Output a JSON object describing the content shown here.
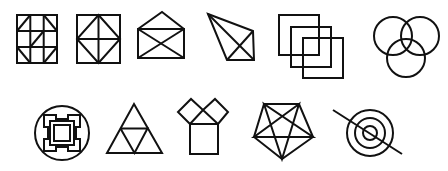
{
  "figure": {
    "background_color": "#ffffff",
    "stroke_color": "#111111",
    "rows": [
      {
        "shapes": [
          {
            "id": "grid-square-diagonals",
            "label": "3x3 grid square with corner and center diagonals"
          },
          {
            "id": "square-diamond-cross",
            "label": "Square with inscribed diamond and cross"
          },
          {
            "id": "open-envelope",
            "label": "Open envelope"
          },
          {
            "id": "kite-quadrilateral",
            "label": "Quadrilateral with both diagonals"
          },
          {
            "id": "overlapping-squares",
            "label": "Three overlapping squares"
          },
          {
            "id": "three-circles",
            "label": "Three overlapping circles (Venn)"
          }
        ]
      },
      {
        "shapes": [
          {
            "id": "circle-knot",
            "label": "Interlaced square knot inside circle"
          },
          {
            "id": "subdivided-triangle",
            "label": "Triangle subdivided into four triangles"
          },
          {
            "id": "pythagoras-squares",
            "label": "Square with two tilted squares above (Pythagoras figure)"
          },
          {
            "id": "pentagon-pentagram",
            "label": "Pentagon with inscribed pentagram"
          },
          {
            "id": "crossed-target",
            "label": "Concentric circles crossed by a diagonal line"
          }
        ]
      }
    ]
  }
}
